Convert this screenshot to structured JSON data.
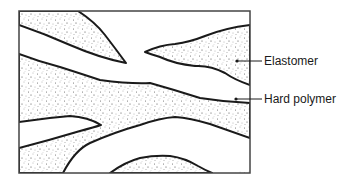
{
  "diagram": {
    "labels": [
      {
        "id": "elastomer",
        "text": "Elastomer",
        "points_to": "stippled region"
      },
      {
        "id": "hard_polymer",
        "text": "Hard polymer",
        "points_to": "white region"
      }
    ],
    "colors": {
      "outline": "#1a1a1a",
      "fill_hard": "#ffffff",
      "stipple": "#555555",
      "frame": "#444444"
    }
  }
}
